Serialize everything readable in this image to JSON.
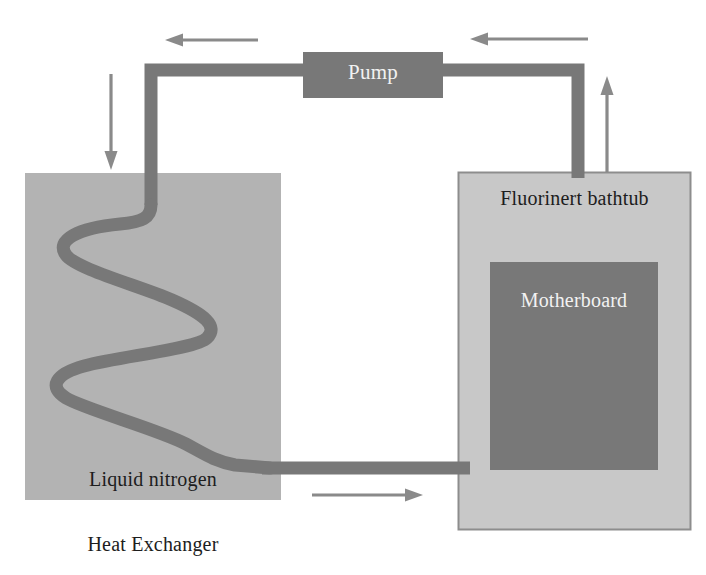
{
  "diagram": {
    "colors": {
      "background": "#ffffff",
      "pipe": "#787878",
      "arrow": "#8a8a8a",
      "heat_exchanger_fill": "#b3b3b3",
      "bathtub_fill": "#c8c8c8",
      "bathtub_border": "#8d8d8d",
      "motherboard_fill": "#787878",
      "pump_fill": "#787878",
      "text_dark": "#1d1d1d",
      "text_light": "#f2f2f2"
    },
    "nodes": {
      "pump": {
        "label": "Pump",
        "x": 303,
        "y": 52,
        "w": 140,
        "h": 46
      },
      "bathtub": {
        "label": "Fluorinert bathtub",
        "x": 458,
        "y": 172,
        "w": 233,
        "h": 358
      },
      "motherboard": {
        "label": "Motherboard",
        "x": 490,
        "y": 262,
        "w": 168,
        "h": 208
      },
      "heat_exchanger": {
        "label": "Liquid nitrogen",
        "caption": "Heat Exchanger",
        "x": 25,
        "y": 173,
        "w": 256,
        "h": 327
      }
    },
    "arrows": [
      {
        "name": "arrow-top-left",
        "direction": "left",
        "x1": 258,
        "y1": 40,
        "x2": 165,
        "y2": 40
      },
      {
        "name": "arrow-top-right",
        "direction": "left",
        "x1": 588,
        "y1": 39,
        "x2": 470,
        "y2": 39
      },
      {
        "name": "arrow-down-left",
        "direction": "down",
        "x1": 111,
        "y1": 74,
        "x2": 111,
        "y2": 168
      },
      {
        "name": "arrow-up-right",
        "direction": "up",
        "x1": 607,
        "y1": 172,
        "x2": 607,
        "y2": 77
      },
      {
        "name": "arrow-bottom-middle",
        "direction": "right",
        "x1": 312,
        "y1": 495,
        "x2": 422,
        "y2": 495
      }
    ],
    "pipe_segments": [
      {
        "name": "pipe-pump-to-left-riser",
        "from": "pump-left",
        "to": "left-riser-top"
      },
      {
        "name": "pipe-left-riser",
        "from": "left-riser-top",
        "to": "heat-exchanger-coil-inlet"
      },
      {
        "name": "pipe-serpentine-coil",
        "from": "coil-inlet",
        "to": "coil-outlet"
      },
      {
        "name": "pipe-coil-to-bathtub",
        "from": "coil-outlet",
        "to": "bathtub-left"
      },
      {
        "name": "pipe-bathtub-riser",
        "from": "bathtub-top",
        "to": "pump-right"
      }
    ]
  }
}
